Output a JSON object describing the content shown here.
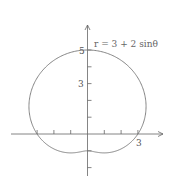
{
  "chart_data": {
    "type": "line",
    "subtype": "polar",
    "title": "",
    "equation_label": "r = 3 + 2 sinθ",
    "series": [
      {
        "name": "r = 3 + 2 sinθ",
        "r_formula": "3 + 2*sin(theta)",
        "theta_range": [
          0,
          6.283185
        ]
      }
    ],
    "x_ticks": [
      -3,
      -2,
      -1,
      1,
      2,
      3
    ],
    "y_ticks": [
      -2,
      -1,
      1,
      2,
      3,
      4,
      5
    ],
    "x_tick_labels": [
      {
        "value": 3,
        "label": "3"
      }
    ],
    "y_tick_labels": [
      {
        "value": 3,
        "label": "3"
      },
      {
        "value": 5,
        "label": "5"
      }
    ],
    "xlim": [
      -4.6,
      4.2
    ],
    "ylim": [
      -2.8,
      6.2
    ],
    "grid": false,
    "colors": {
      "curve": "#777777",
      "axis": "#666666"
    }
  }
}
